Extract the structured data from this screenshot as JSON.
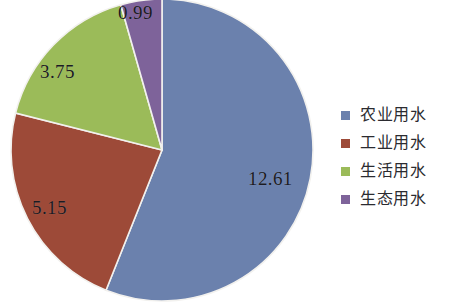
{
  "chart_data": {
    "type": "pie",
    "title": "",
    "subtitle": "",
    "xlabel": "",
    "ylabel": "",
    "grid": false,
    "legend_position": "right",
    "start_angle_deg": 0,
    "direction": "clockwise",
    "total": 22.5,
    "categories": [
      "农业用水",
      "工业用水",
      "生活用水",
      "生态用水"
    ],
    "values": [
      12.61,
      5.15,
      3.75,
      0.99
    ],
    "labels": [
      "12.61",
      "5.15",
      "3.75",
      "0.99"
    ],
    "colors": [
      "#6b81ad",
      "#9d4a38",
      "#9bbb59",
      "#7e639a"
    ],
    "slices": [
      {
        "name": "农业用水",
        "value": 12.61,
        "label": "12.61",
        "color": "#6b81ad",
        "percent": 56.04,
        "start_deg": 0,
        "end_deg": 201.76
      },
      {
        "name": "工业用水",
        "value": 5.15,
        "label": "5.15",
        "color": "#9d4a38",
        "percent": 22.89,
        "start_deg": 201.76,
        "end_deg": 284.16
      },
      {
        "name": "生活用水",
        "value": 3.75,
        "label": "3.75",
        "color": "#9bbb59",
        "percent": 16.67,
        "start_deg": 284.16,
        "end_deg": 344.16
      },
      {
        "name": "生态用水",
        "value": 0.99,
        "label": "0.99",
        "color": "#7e639a",
        "percent": 4.4,
        "start_deg": 344.16,
        "end_deg": 360
      }
    ]
  },
  "legend": {
    "items": [
      {
        "label": "农业用水",
        "color": "#6b81ad",
        "swatch_name": "legend-swatch-agricultural"
      },
      {
        "label": "工业用水",
        "color": "#9d4a38",
        "swatch_name": "legend-swatch-industrial"
      },
      {
        "label": "生活用水",
        "color": "#9bbb59",
        "swatch_name": "legend-swatch-domestic"
      },
      {
        "label": "生态用水",
        "color": "#7e639a",
        "swatch_name": "legend-swatch-ecological"
      }
    ]
  }
}
